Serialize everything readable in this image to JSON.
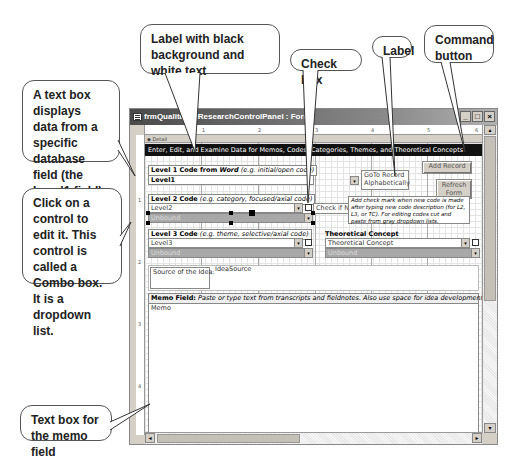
{
  "callouts": {
    "label_black_bg": "Label with black background and white text",
    "check_box": "Check box",
    "label": "Label",
    "command_button": "Command button",
    "text_box_field": "A text box displays data from a specific database field (the Level1 field)",
    "combo_box": "Click on a control to edit it. This control is called a Combo box. It is a dropdown list.",
    "memo_text_box": "Text box for the memo field"
  },
  "window": {
    "title": "frmQualitativeResearchControlPanel : Form",
    "buttons": {
      "minimize": "_",
      "maximize": "□",
      "close": "×"
    },
    "ruler_marks": [
      "1",
      "2",
      "3",
      "4",
      "5",
      "6"
    ],
    "vertical_ruler_marks": [
      "1",
      "2",
      "3",
      "4"
    ],
    "section": "Detail"
  },
  "form": {
    "header_label": "Enter, Edit, and Examine Data for Memos, Codes, Categories, Themes, and Theoretical Concepts",
    "level1": {
      "label_bold": "Level 1 Code from ",
      "label_italic_bold": "Word",
      "label_hint": " (e.g. initial/open code)",
      "field": "Level1"
    },
    "goto_record_label": "GoTo Record Alphabetically",
    "add_record_button": "Add Record",
    "refresh_form_button": "Refresh Form",
    "level2": {
      "label_bold": "Level 2 Code",
      "label_hint": " (e.g. category, focused/axial code)",
      "combo_value": "Level2",
      "unbound_value": "Unbound"
    },
    "check_if_new_label": "Check if New",
    "note": "Add check mark when new code is made after typing new code description (for L2, L3, or TC). For editing codes cut and paste from gray dropdown lists.",
    "level3": {
      "label_bold": "Level 3 Code",
      "label_hint": " (e.g. theme, selective/axial code)",
      "combo_value": "Level3",
      "unbound_value": "Unbound"
    },
    "theoretical": {
      "label_bold": "Theoretical Concept",
      "combo_value": "Theoretical Concept",
      "unbound_value": "Unbound"
    },
    "source": {
      "label": "Source of the Idea:",
      "field": "IdeaSource"
    },
    "memo": {
      "label_bold": "Memo Field:",
      "label_hint": " Paste or type text from transcripts and fieldnotes. Also use space for idea development.",
      "field": "Memo"
    }
  }
}
